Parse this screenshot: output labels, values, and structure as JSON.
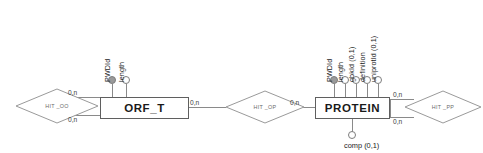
{
  "diagram": {
    "type": "entity-relationship-diagram",
    "entities": [
      {
        "id": "orf_t",
        "name": "ORF_T",
        "attributes": [
          {
            "label": "PWDId",
            "key": true
          },
          {
            "label": "length",
            "key": false
          }
        ]
      },
      {
        "id": "protein",
        "name": "PROTEIN",
        "attributes": [
          {
            "label": "PWDId",
            "key": true
          },
          {
            "label": "length",
            "key": false
          },
          {
            "label": "gbkId (0,1)",
            "key": false
          },
          {
            "label": "definition",
            "key": false
          },
          {
            "label": "uniprotId (0,1)",
            "key": false
          }
        ],
        "bottom_attribute": {
          "label": "comp (0,1)",
          "key": false
        }
      }
    ],
    "relationships": [
      {
        "id": "hit_oo",
        "name": "HIT _OO"
      },
      {
        "id": "hit_op",
        "name": "HIT _OP"
      },
      {
        "id": "hit_pp",
        "name": "HIT _PP"
      }
    ],
    "cardinalities": {
      "hit_oo_top": "0,n",
      "hit_oo_bottom": "0,n",
      "orf_t_right": "0,n",
      "hit_op_right": "0,n",
      "hit_pp_top": "0,n",
      "hit_pp_bottom": "0,n"
    },
    "colors": {
      "line": "#8a8a8a",
      "box_border": "#5f5f5f",
      "key_fill": "#9a9a9a",
      "text": "#1a1a1a",
      "diamond_stroke": "#9a9a9a"
    }
  }
}
